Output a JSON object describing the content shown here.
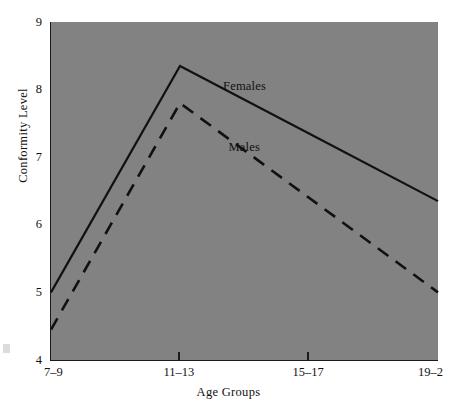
{
  "chart_data": {
    "type": "line",
    "title": "",
    "xlabel": "Age Groups",
    "ylabel": "Conformity Level",
    "categories": [
      "7–9",
      "11–13",
      "15–17",
      "19–2"
    ],
    "ylim": [
      4,
      9
    ],
    "yticks": [
      "4",
      "5",
      "6",
      "7",
      "8",
      "9"
    ],
    "ytick_values": [
      4,
      5,
      6,
      7,
      8,
      9
    ],
    "grid": false,
    "legend_position": "inline-annotations",
    "series": [
      {
        "name": "Females",
        "style": "solid",
        "color": "#111111",
        "values": [
          5.0,
          8.35,
          7.35,
          6.35
        ]
      },
      {
        "name": "Males",
        "style": "dashed",
        "color": "#111111",
        "values": [
          4.45,
          7.8,
          6.4,
          5.0
        ]
      }
    ],
    "annotations": [
      {
        "text": "Females",
        "series": "Females",
        "x_frac": 0.5,
        "y_value": 8.05
      },
      {
        "text": "Males",
        "series": "Males",
        "x_frac": 0.5,
        "y_value": 7.15
      }
    ],
    "plot_background_color": "#828282",
    "axis_color": "#1a1a1a"
  }
}
